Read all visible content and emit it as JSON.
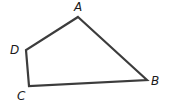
{
  "diagram": {
    "type": "quadrilateral",
    "stroke_color": "#3c3c3c",
    "stroke_width": 2.2,
    "vertices": [
      {
        "name": "A",
        "x": 78,
        "y": 17,
        "label_x": 74,
        "label_y": 11
      },
      {
        "name": "B",
        "x": 147,
        "y": 80,
        "label_x": 151,
        "label_y": 85
      },
      {
        "name": "C",
        "x": 29,
        "y": 86,
        "label_x": 17,
        "label_y": 100
      },
      {
        "name": "D",
        "x": 26,
        "y": 50,
        "label_x": 10,
        "label_y": 54
      }
    ],
    "labels": {
      "A": "A",
      "B": "B",
      "C": "C",
      "D": "D"
    },
    "edges": [
      "AB",
      "BC",
      "CD",
      "DA"
    ]
  }
}
